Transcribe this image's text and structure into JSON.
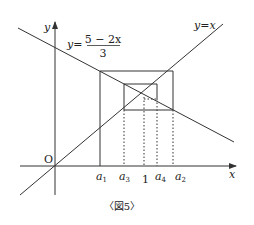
{
  "figure": {
    "caption": "〈図5〉",
    "axes": {
      "x_label": "x",
      "y_label": "y",
      "origin_label": "O"
    },
    "lines": {
      "identity": {
        "label": "y = x",
        "lhs": "y",
        "eq": "=",
        "rhs": "x"
      },
      "decreasing": {
        "lhs": "y",
        "eq": "=",
        "numerator": "5 − 2x",
        "denominator": "3"
      }
    },
    "x_ticks": [
      {
        "base": "a",
        "sub": "1"
      },
      {
        "base": "a",
        "sub": "3"
      },
      {
        "plain": "1"
      },
      {
        "base": "a",
        "sub": "4"
      },
      {
        "base": "a",
        "sub": "2"
      }
    ],
    "colors": {
      "stroke": "#333333",
      "background": "#ffffff"
    }
  }
}
